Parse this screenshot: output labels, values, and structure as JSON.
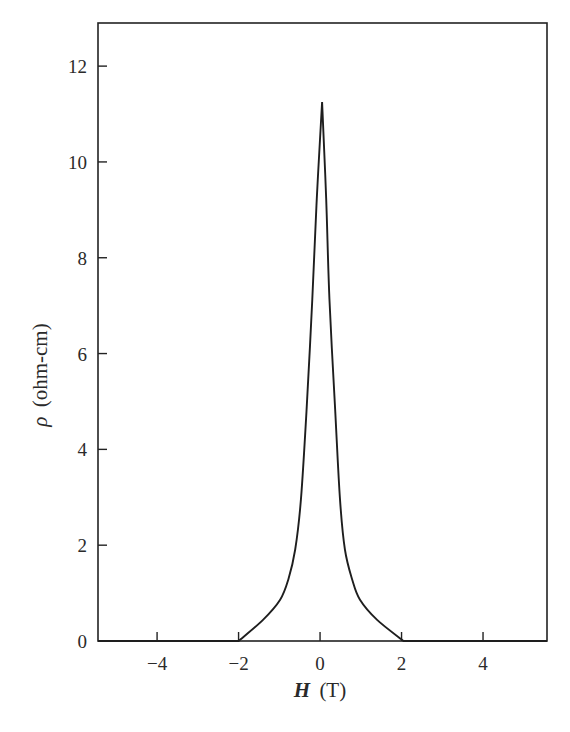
{
  "chart_data": {
    "type": "line",
    "title": "",
    "xlabel": "H (T)",
    "xlabel_parts": {
      "symbol": "H",
      "unit": "(T)"
    },
    "ylabel": "ρ (ohm-cm)",
    "ylabel_parts": {
      "symbol": "ρ",
      "unit": "(ohm-cm)"
    },
    "xlim": [
      -5.45,
      5.57
    ],
    "ylim": [
      0,
      12.9
    ],
    "xticks": [
      -4,
      -2,
      0,
      2,
      4
    ],
    "xtick_labels": [
      "−4",
      "−2",
      "0",
      "2",
      "4"
    ],
    "yticks": [
      0,
      2,
      4,
      6,
      8,
      10,
      12
    ],
    "ytick_labels": [
      "0",
      "2",
      "4",
      "6",
      "8",
      "10",
      "12"
    ],
    "grid": false,
    "legend": null,
    "frame": "box",
    "series": [
      {
        "name": "ρ(H)",
        "color": "#1e1e1e",
        "x": [
          -5.45,
          -2.0,
          -1.4,
          -0.98,
          -0.78,
          -0.61,
          -0.47,
          -0.33,
          -0.19,
          -0.08,
          0.05,
          0.15,
          0.23,
          0.37,
          0.49,
          0.61,
          0.79,
          0.98,
          1.4,
          2.05,
          5.57
        ],
        "y": [
          0,
          0,
          0.44,
          0.86,
          1.28,
          1.91,
          2.95,
          4.84,
          7.14,
          9.24,
          11.25,
          9.24,
          7.14,
          4.84,
          2.95,
          1.91,
          1.28,
          0.86,
          0.44,
          0,
          0
        ]
      }
    ],
    "annotations": []
  }
}
